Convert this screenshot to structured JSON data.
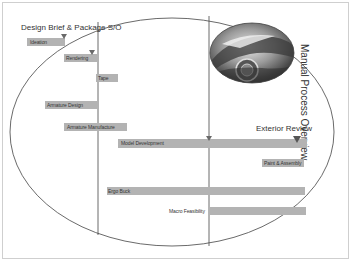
{
  "header": {
    "title": "Design Brief & Package S/O"
  },
  "side_title": "Manual Process Overview",
  "milestones": {
    "exterior_review": "Exterior Review"
  },
  "colors": {
    "bar": "#b3b3b3",
    "line": "#555555",
    "frame": "#cfcfcf"
  },
  "tasks": [
    {
      "label": "Ideation"
    },
    {
      "label": "Rendering"
    },
    {
      "label": "Tape"
    },
    {
      "label": "Armature Design"
    },
    {
      "label": "Armature Manufacture"
    },
    {
      "label": "Model Development"
    },
    {
      "label": "Paint & Assembly"
    },
    {
      "label": "Ergo Buck"
    },
    {
      "label": "Macro Feasibility"
    }
  ],
  "image": {
    "subject": "concept-car-photo"
  }
}
